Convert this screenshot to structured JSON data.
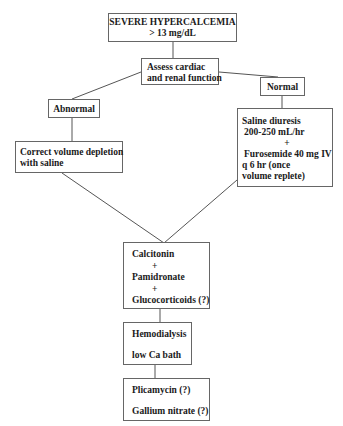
{
  "diagram": {
    "title_node": {
      "line1": "SEVERE HYPERCALCEMIA",
      "line2": "> 13 mg/dL"
    },
    "assess_node": {
      "line1": "Assess cardiac",
      "line2": "and renal function"
    },
    "abnormal_node": {
      "label": "Abnormal"
    },
    "normal_node": {
      "label": "Normal"
    },
    "correct_node": {
      "line1": "Correct volume depletion",
      "line2": "with saline"
    },
    "saline_node": {
      "line1": "Saline diuresis",
      "line2": "200-250 mL/hr",
      "plus": "+",
      "line3": "Furosemide 40 mg IV",
      "line4": "q 6 hr (once",
      "line5": "volume replete)"
    },
    "drug_node": {
      "line1": "Calcitonin",
      "plus1": "+",
      "line2": "Pamidronate",
      "plus2": "+",
      "line3": "Glucocorticoids (?)"
    },
    "dialysis_node": {
      "line1": "Hemodialysis",
      "line2": "low Ca bath"
    },
    "last_node": {
      "line1": "Plicamycin (?)",
      "line2": "Gallium nitrate (?)"
    }
  }
}
